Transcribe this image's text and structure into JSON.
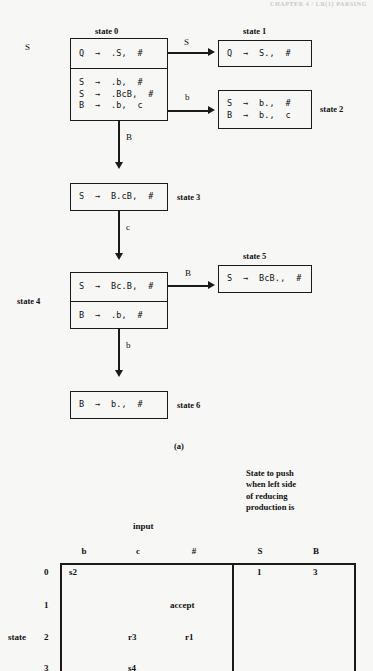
{
  "page": {
    "header_note": "CHAPTER 4 / LR(1) PARSING",
    "background": "#f7f7f5",
    "ink": "#1a1a1a"
  },
  "figure": {
    "caption": "(a)",
    "entry_label": "S",
    "states": [
      {
        "id": "state0",
        "label": "state 0",
        "rows": [
          {
            "productions": [
              "Q  →  .S,  #"
            ]
          },
          {
            "productions": [
              "S  →  .b,  #",
              "S  →  .BcB,  #",
              "B  →  .b,  c"
            ]
          }
        ]
      },
      {
        "id": "state1",
        "label": "state 1",
        "rows": [
          {
            "productions": [
              "Q  →  S.,  #"
            ]
          }
        ]
      },
      {
        "id": "state2",
        "label": "state 2",
        "rows": [
          {
            "productions": [
              "S  →  b.,  #",
              "B  →  b.,  c"
            ]
          }
        ]
      },
      {
        "id": "state3",
        "label": "state 3",
        "rows": [
          {
            "productions": [
              "S  →  B.cB,  #"
            ]
          }
        ]
      },
      {
        "id": "state4",
        "label": "state 4",
        "rows": [
          {
            "productions": [
              "S  →  Bc.B,  #"
            ]
          },
          {
            "productions": [
              "B  →  .b,  #"
            ]
          }
        ]
      },
      {
        "id": "state5",
        "label": "state 5",
        "rows": [
          {
            "productions": [
              "S  →  BcB.,  #"
            ]
          }
        ]
      },
      {
        "id": "state6",
        "label": "state 6",
        "rows": [
          {
            "productions": [
              "B  →  b.,  #"
            ]
          }
        ]
      }
    ],
    "transitions": [
      {
        "from": "state0",
        "to": "state1",
        "symbol": "S"
      },
      {
        "from": "state0",
        "to": "state2",
        "symbol": "b"
      },
      {
        "from": "state0",
        "to": "state3",
        "symbol": "B"
      },
      {
        "from": "state3",
        "to": "state4",
        "symbol": "c"
      },
      {
        "from": "state4",
        "to": "state5",
        "symbol": "B"
      },
      {
        "from": "state4",
        "to": "state6",
        "symbol": "b"
      }
    ]
  },
  "table": {
    "row_axis_label": "state",
    "input_group_label": "input",
    "goto_group_label": "State to push\nwhen left side\nof reducing\nproduction is",
    "input_columns": [
      "b",
      "c",
      "#"
    ],
    "goto_columns": [
      "S",
      "B"
    ],
    "rows": [
      {
        "state": "0",
        "b": "s2",
        "c": "",
        "hash": "",
        "S": "1",
        "B": "3"
      },
      {
        "state": "1",
        "b": "",
        "c": "",
        "hash": "accept",
        "S": "",
        "B": ""
      },
      {
        "state": "2",
        "b": "",
        "c": "r3",
        "hash": "r1",
        "S": "",
        "B": ""
      },
      {
        "state": "3",
        "b": "",
        "c": "s4",
        "hash": "",
        "S": "",
        "B": ""
      }
    ]
  }
}
